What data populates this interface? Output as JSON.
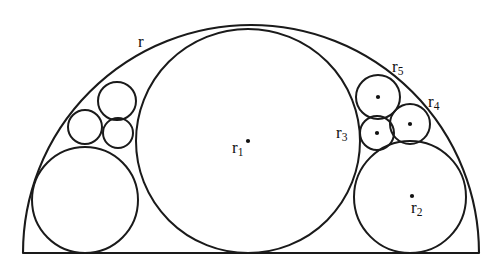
{
  "figure": {
    "background_color": "#ffffff",
    "stroke_color": "#1a1a1a",
    "dot_color": "#111111",
    "canvas": {
      "width": 498,
      "height": 273
    },
    "baseline": {
      "x1": 24,
      "y1": 253,
      "x2": 478,
      "y2": 253
    },
    "outer_arc": {
      "cx": 251,
      "cy": 253,
      "r": 228,
      "label": "r"
    },
    "circles": [
      {
        "name": "circle-r1",
        "cx": 248,
        "cy": 141,
        "r": 112,
        "label": "r",
        "sub": "1",
        "has_dot": true,
        "dot_cx": 248,
        "dot_cy": 141
      },
      {
        "name": "circle-r2",
        "cx": 410,
        "cy": 197,
        "r": 56,
        "label": "r",
        "sub": "2",
        "has_dot": true,
        "dot_cx": 412,
        "dot_cy": 196
      },
      {
        "name": "circle-bottom-left",
        "cx": 85,
        "cy": 200,
        "r": 53,
        "label": "",
        "sub": "",
        "has_dot": false
      },
      {
        "name": "circle-left-upper",
        "cx": 117,
        "cy": 101,
        "r": 19,
        "label": "",
        "sub": "",
        "has_dot": false
      },
      {
        "name": "circle-left-middle",
        "cx": 85,
        "cy": 127,
        "r": 17,
        "label": "",
        "sub": "",
        "has_dot": false
      },
      {
        "name": "circle-left-lower",
        "cx": 118,
        "cy": 133,
        "r": 15,
        "label": "",
        "sub": "",
        "has_dot": false
      },
      {
        "name": "circle-r5",
        "cx": 378,
        "cy": 97,
        "r": 22,
        "label": "r",
        "sub": "5",
        "has_dot": true,
        "dot_cx": 378,
        "dot_cy": 97
      },
      {
        "name": "circle-r4",
        "cx": 410,
        "cy": 124,
        "r": 20,
        "label": "r",
        "sub": "4",
        "has_dot": true,
        "dot_cx": 410,
        "dot_cy": 124
      },
      {
        "name": "circle-r3",
        "cx": 377,
        "cy": 133,
        "r": 17,
        "label": "r",
        "sub": "3",
        "has_dot": true,
        "dot_cx": 377,
        "dot_cy": 133
      }
    ],
    "labels": [
      {
        "name": "label-r",
        "text": "r",
        "sub": "",
        "x": 138,
        "y": 33
      },
      {
        "name": "label-r1",
        "text": "r",
        "sub": "1",
        "x": 232,
        "y": 139
      },
      {
        "name": "label-r2",
        "text": "r",
        "sub": "2",
        "x": 411,
        "y": 199
      },
      {
        "name": "label-r3",
        "text": "r",
        "sub": "3",
        "x": 336,
        "y": 124
      },
      {
        "name": "label-r4",
        "text": "r",
        "sub": "4",
        "x": 428,
        "y": 93
      },
      {
        "name": "label-r5",
        "text": "r",
        "sub": "5",
        "x": 392,
        "y": 58
      }
    ]
  }
}
